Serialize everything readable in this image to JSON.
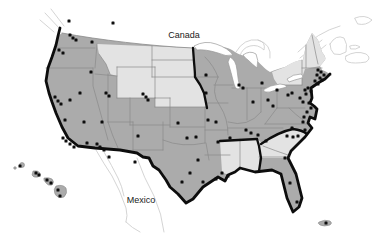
{
  "window": {
    "width": 385,
    "height": 239
  },
  "map": {
    "labels": {
      "canada": {
        "text": "Canada"
      },
      "mexico": {
        "text": "Mexico"
      }
    },
    "colors": {
      "background": "#ffffff",
      "state_fill": "#ababab",
      "light_state_fill": "#e3e3e3",
      "state_border": "#8a8a8a",
      "bold_boundary": "#0d0d0d",
      "neighbor_outline": "#c9c9c9",
      "lake_fill": "#ffffff",
      "lake_outline": "#9a9a9a",
      "marker": "#0d0d0d",
      "label_text": "#1a1a1a"
    },
    "marker_size": 3,
    "markers": [
      [
        69,
        21
      ],
      [
        113,
        23
      ],
      [
        70,
        35
      ],
      [
        73,
        38
      ],
      [
        76,
        40
      ],
      [
        92,
        42
      ],
      [
        59,
        50
      ],
      [
        63,
        53
      ],
      [
        91,
        72
      ],
      [
        80,
        93
      ],
      [
        84,
        122
      ],
      [
        55,
        97
      ],
      [
        58,
        101
      ],
      [
        61,
        104
      ],
      [
        70,
        100
      ],
      [
        65,
        120
      ],
      [
        106,
        93
      ],
      [
        109,
        96
      ],
      [
        102,
        122
      ],
      [
        63,
        138
      ],
      [
        66,
        141
      ],
      [
        70,
        144
      ],
      [
        74,
        147
      ],
      [
        87,
        143
      ],
      [
        97,
        144
      ],
      [
        100,
        147
      ],
      [
        104,
        150
      ],
      [
        109,
        157
      ],
      [
        143,
        94
      ],
      [
        146,
        97
      ],
      [
        148,
        100
      ],
      [
        138,
        136
      ],
      [
        135,
        162
      ],
      [
        178,
        123
      ],
      [
        187,
        138
      ],
      [
        196,
        137
      ],
      [
        208,
        120
      ],
      [
        216,
        122
      ],
      [
        218,
        142
      ],
      [
        230,
        138
      ],
      [
        198,
        160
      ],
      [
        190,
        173
      ],
      [
        182,
        182
      ],
      [
        203,
        182
      ],
      [
        216,
        179
      ],
      [
        206,
        75
      ],
      [
        206,
        93
      ],
      [
        239,
        85
      ],
      [
        243,
        88
      ],
      [
        253,
        102
      ],
      [
        262,
        83
      ],
      [
        277,
        90
      ],
      [
        268,
        100
      ],
      [
        273,
        106
      ],
      [
        246,
        130
      ],
      [
        251,
        133
      ],
      [
        258,
        135
      ],
      [
        266,
        141
      ],
      [
        222,
        173
      ],
      [
        228,
        176
      ],
      [
        288,
        95
      ],
      [
        292,
        93
      ],
      [
        300,
        98
      ],
      [
        303,
        102
      ],
      [
        305,
        90
      ],
      [
        308,
        88
      ],
      [
        311,
        91
      ],
      [
        306,
        94
      ],
      [
        318,
        70
      ],
      [
        321,
        72
      ],
      [
        324,
        75
      ],
      [
        317,
        75
      ],
      [
        320,
        78
      ],
      [
        315,
        81
      ],
      [
        318,
        84
      ],
      [
        322,
        80
      ],
      [
        309,
        103
      ],
      [
        311,
        108
      ],
      [
        307,
        112
      ],
      [
        304,
        117
      ],
      [
        303,
        122
      ],
      [
        292,
        128
      ],
      [
        305,
        130
      ],
      [
        287,
        136
      ],
      [
        293,
        137
      ],
      [
        298,
        136
      ],
      [
        285,
        158
      ],
      [
        290,
        183
      ],
      [
        297,
        202
      ],
      [
        326,
        223
      ],
      [
        20,
        166
      ],
      [
        36,
        173
      ],
      [
        39,
        175
      ],
      [
        47,
        180
      ],
      [
        51,
        183
      ],
      [
        58,
        190
      ],
      [
        60,
        196
      ]
    ]
  }
}
